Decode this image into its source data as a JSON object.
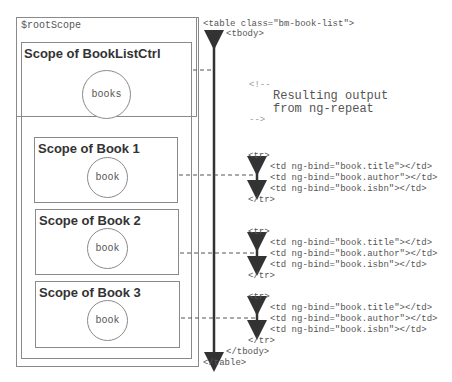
{
  "scopes": {
    "root": {
      "label": "$rootScope"
    },
    "controller": {
      "label": "Scope of BookListCtrl",
      "model": "books"
    },
    "books": [
      {
        "label": "Scope of Book 1",
        "model": "book"
      },
      {
        "label": "Scope of Book 2",
        "model": "book"
      },
      {
        "label": "Scope of Book 3",
        "model": "book"
      }
    ]
  },
  "code": {
    "table_open": "<table class=\"bm-book-list\">",
    "tbody_open": "<tbody>",
    "comment_open": "<!--",
    "comment_line1": "Resulting output",
    "comment_line2": "from ng-repeat",
    "comment_close": "-->",
    "rows": [
      {
        "tr_open": "<tr>",
        "td1": "<td ng-bind=\"book.title\"></td>",
        "td2": "<td ng-bind=\"book.author\"></td>",
        "td3": "<td ng-bind=\"book.isbn\"></td>",
        "tr_close": "</tr>"
      },
      {
        "tr_open": "<tr>",
        "td1": "<td ng-bind=\"book.title\"></td>",
        "td2": "<td ng-bind=\"book.author\"></td>",
        "td3": "<td ng-bind=\"book.isbn\"></td>",
        "tr_close": "</tr>"
      },
      {
        "tr_open": "<tr>",
        "td1": "<td ng-bind=\"book.title\"></td>",
        "td2": "<td ng-bind=\"book.author\"></td>",
        "td3": "<td ng-bind=\"book.isbn\"></td>",
        "tr_close": "</tr>"
      }
    ],
    "tbody_close": "</tbody>",
    "table_close": "</table>"
  }
}
